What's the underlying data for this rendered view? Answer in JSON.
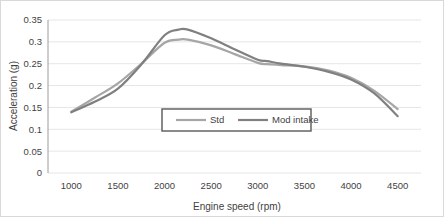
{
  "chart_data": {
    "type": "line",
    "title": "",
    "xlabel": "Engine speed (rpm)",
    "ylabel": "Acceleration (g)",
    "xlim": [
      750,
      4750
    ],
    "ylim": [
      0,
      0.35
    ],
    "grid": true,
    "grid_axis": "y",
    "legend_position": "center",
    "x_ticks": [
      1000,
      1500,
      2000,
      2500,
      3000,
      3500,
      4000,
      4500
    ],
    "x_tick_labels": [
      "1000",
      "1500",
      "2000",
      "2500",
      "3000",
      "3500",
      "4000",
      "4500"
    ],
    "y_ticks": [
      0,
      0.05,
      0.1,
      0.15,
      0.2,
      0.25,
      0.3,
      0.35
    ],
    "y_tick_labels": [
      "0",
      "0.05",
      "0.1",
      "0.15",
      "0.2",
      "0.25",
      "0.3",
      "0.35"
    ],
    "x": [
      1000,
      1250,
      1500,
      1750,
      2000,
      2150,
      2250,
      2500,
      2750,
      3000,
      3100,
      3250,
      3500,
      3750,
      4000,
      4250,
      4500
    ],
    "series": [
      {
        "name": "Std",
        "color": "#a6a6a6",
        "values": [
          0.14,
          0.172,
          0.205,
          0.25,
          0.298,
          0.305,
          0.305,
          0.292,
          0.272,
          0.252,
          0.249,
          0.247,
          0.244,
          0.235,
          0.218,
          0.188,
          0.146
        ]
      },
      {
        "name": "Mod intake",
        "color": "#808080",
        "values": [
          0.139,
          0.163,
          0.193,
          0.248,
          0.315,
          0.328,
          0.328,
          0.308,
          0.283,
          0.259,
          0.256,
          0.25,
          0.243,
          0.232,
          0.214,
          0.182,
          0.13
        ]
      }
    ]
  },
  "legend": {
    "entries": [
      {
        "label": "Std"
      },
      {
        "label": "Mod intake"
      }
    ]
  },
  "colors": {
    "series_std": "#a6a6a6",
    "series_mod": "#808080",
    "gridline": "#e6e6e6",
    "axis": "#9c9c9c",
    "text": "#3f3f3f",
    "legend_border": "#595959",
    "frame_border": "#d9d9d9"
  }
}
